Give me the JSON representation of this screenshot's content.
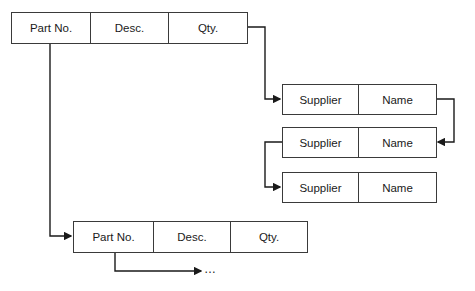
{
  "part_record_top": {
    "fields": [
      "Part No.",
      "Desc.",
      "Qty."
    ]
  },
  "supplier_records": [
    {
      "fields": [
        "Supplier",
        "Name"
      ]
    },
    {
      "fields": [
        "Supplier",
        "Name"
      ]
    },
    {
      "fields": [
        "Supplier",
        "Name"
      ]
    }
  ],
  "part_record_bottom": {
    "fields": [
      "Part No.",
      "Desc.",
      "Qty."
    ]
  },
  "continuation": "…",
  "colors": {
    "line": "#1a1a1a",
    "border": "#3a3a3a",
    "background": "#ffffff"
  }
}
